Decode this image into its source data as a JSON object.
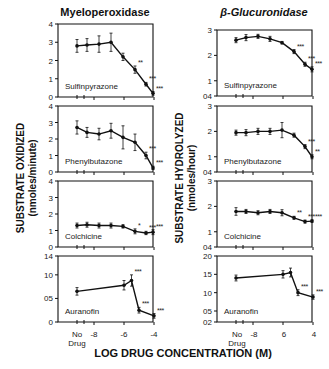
{
  "chart_data": [
    {
      "type": "line",
      "title": "Myeloperoxidase",
      "panel": "Sulfinpyrazone",
      "ylabel": "SUBSTRATE OXIDIZED (nmoles/minute)",
      "xlabel": "LOG DRUG CONCENTRATION (M)",
      "yticks": [
        "0",
        "1",
        "2",
        "3",
        "4"
      ],
      "ylim": [
        0,
        4
      ],
      "x": [
        "No Drug",
        -7.5,
        -7,
        -6.5,
        -6,
        -5.5,
        -5,
        -4.5
      ],
      "values": [
        2.8,
        2.85,
        2.9,
        3.0,
        2.2,
        1.5,
        0.7,
        0.2
      ],
      "err": [
        0.35,
        0.35,
        0.45,
        0.5,
        0.2,
        0.2,
        0.1,
        0.1
      ],
      "sig": [
        "",
        "",
        "",
        "",
        "",
        "**",
        "***",
        "***"
      ]
    },
    {
      "type": "line",
      "title": "Myeloperoxidase",
      "panel": "Phenylbutazone",
      "yticks": [
        "0",
        "1",
        "2",
        "3",
        "4"
      ],
      "ylim": [
        0,
        4
      ],
      "x": [
        "No Drug",
        -7.5,
        -7,
        -6.5,
        -6,
        -5.5,
        -5,
        -4.5
      ],
      "values": [
        2.7,
        2.4,
        2.3,
        2.5,
        2.1,
        1.8,
        1.0,
        0.25
      ],
      "err": [
        0.4,
        0.3,
        0.35,
        0.45,
        0.7,
        0.5,
        0.2,
        0.1
      ],
      "sig": [
        "",
        "",
        "",
        "",
        "",
        "",
        "***",
        "***"
      ]
    },
    {
      "type": "line",
      "title": "Myeloperoxidase",
      "panel": "Colchicine",
      "yticks": [
        "0",
        "1",
        "2",
        "3",
        "4"
      ],
      "ylim": [
        0,
        4
      ],
      "x": [
        "No Drug",
        -7.5,
        -7,
        -6.5,
        -6,
        -5.5,
        -5,
        -4.5
      ],
      "values": [
        1.3,
        1.35,
        1.3,
        1.3,
        1.25,
        0.95,
        0.85,
        0.9
      ],
      "err": [
        0.15,
        0.15,
        0.15,
        0.15,
        0.1,
        0.15,
        0.1,
        0.15
      ],
      "sig": [
        "",
        "",
        "",
        "",
        "",
        "*",
        "***",
        "***"
      ]
    },
    {
      "type": "line",
      "title": "Myeloperoxidase",
      "panel": "Auranofin",
      "yticks": [
        "0",
        "05",
        "10",
        "14"
      ],
      "ylim": [
        0,
        14
      ],
      "x": [
        "No Drug",
        -6,
        -5.5,
        -5,
        -4
      ],
      "values": [
        6.5,
        7.8,
        8.8,
        2.5,
        1.3
      ],
      "err": [
        0.8,
        1.0,
        1.2,
        0.6,
        0.5
      ],
      "sig": [
        "",
        "",
        "***",
        "***",
        "***"
      ]
    },
    {
      "type": "line",
      "title": "β-Glucuronidase",
      "panel": "Sulfinpyrazone",
      "ylabel": "SUBSTRATE HYDROLYZED (nmoles/hour)",
      "yticks": [
        "04",
        "1",
        "2",
        "3"
      ],
      "ylim": [
        0.4,
        3
      ],
      "x": [
        "No Drug",
        -7.5,
        -7,
        -6.5,
        -6,
        -5.5,
        -5,
        -4.5
      ],
      "values": [
        2.6,
        2.7,
        2.75,
        2.65,
        2.5,
        2.15,
        1.65,
        1.45
      ],
      "err": [
        0.1,
        0.12,
        0.08,
        0.1,
        0.05,
        0.08,
        0.08,
        0.1
      ],
      "sig": [
        "",
        "",
        "",
        "",
        "",
        "***",
        "***",
        "***"
      ]
    },
    {
      "type": "line",
      "title": "β-Glucuronidase",
      "panel": "Phenylbutazone",
      "yticks": [
        "04",
        "1",
        "2",
        "3"
      ],
      "ylim": [
        0.4,
        3
      ],
      "x": [
        "No Drug",
        -7.5,
        -7,
        -6.5,
        -6,
        -5.5,
        -5,
        -4.5
      ],
      "values": [
        1.95,
        1.95,
        2.0,
        2.0,
        2.05,
        1.85,
        1.4,
        1.0
      ],
      "err": [
        0.1,
        0.12,
        0.12,
        0.12,
        0.3,
        0.08,
        0.08,
        0.08
      ],
      "sig": [
        "",
        "",
        "",
        "",
        "",
        "",
        "***",
        "**"
      ]
    },
    {
      "type": "line",
      "title": "β-Glucuronidase",
      "panel": "Colchicine",
      "yticks": [
        "04",
        "1",
        "2",
        "3"
      ],
      "ylim": [
        0.4,
        3
      ],
      "x": [
        "No Drug",
        -7.5,
        -7,
        -6.5,
        -6,
        -5.5,
        -5,
        -4.5
      ],
      "values": [
        1.8,
        1.8,
        1.75,
        1.8,
        1.75,
        1.55,
        1.4,
        1.42
      ],
      "err": [
        0.15,
        0.08,
        0.08,
        0.08,
        0.12,
        0.06,
        0.06,
        0.05
      ],
      "sig": [
        "",
        "",
        "",
        "",
        "",
        "**",
        "***",
        "***"
      ]
    },
    {
      "type": "line",
      "title": "β-Glucuronidase",
      "panel": "Auranofin",
      "yticks": [
        "02",
        "05",
        "10",
        "15",
        "20"
      ],
      "ylim": [
        0.2,
        2.0
      ],
      "x": [
        "No Drug",
        -6,
        -5.5,
        -5,
        -4
      ],
      "values": [
        1.4,
        1.5,
        1.55,
        1.0,
        0.88
      ],
      "err": [
        0.08,
        0.1,
        0.12,
        0.08,
        0.06
      ],
      "sig": [
        "",
        "",
        "",
        "***",
        "***"
      ]
    }
  ],
  "titles": {
    "left": "Myeloperoxidase",
    "right": "β-Glucuronidase"
  },
  "ylabels": {
    "left_1": "SUBSTRATE OXIDIZED",
    "left_2": "(nmoles/minute)",
    "right_1": "SUBSTRATE   HYDROLYZED",
    "right_2": "(nmoles/hour)"
  },
  "xlabel": "LOG DRUG CONCENTRATION (M)",
  "xticks": {
    "no": "No",
    "drug": "Drug",
    "m8": "-8",
    "m6": "-6",
    "m4": "-4",
    "r_m8": "-8",
    "r_m6": "6",
    "r_m4": "4"
  }
}
